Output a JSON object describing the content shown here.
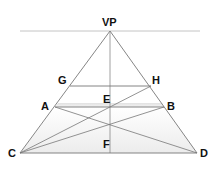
{
  "diagram": {
    "labels": {
      "vp": "VP",
      "g": "G",
      "h": "H",
      "a": "A",
      "e": "E",
      "b": "B",
      "c": "C",
      "f": "F",
      "d": "D"
    },
    "colors": {
      "line": "#7a7a7a",
      "horizon": "#bdbdbd",
      "shade": "#e6e6e6",
      "text": "#111111"
    }
  }
}
